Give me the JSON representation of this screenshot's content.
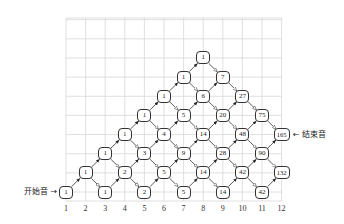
{
  "diagram": {
    "type": "lattice-path-counting",
    "grid": {
      "columns": 12,
      "rows": 10
    },
    "column_labels": [
      "1",
      "2",
      "3",
      "4",
      "5",
      "6",
      "7",
      "8",
      "9",
      "10",
      "11",
      "12"
    ],
    "start_label": "开始音",
    "start_arrow": "→",
    "end_label": "结束音",
    "end_arrow": "←",
    "nodes": [
      {
        "col": 1,
        "row": 0,
        "value": "1"
      },
      {
        "col": 3,
        "row": 0,
        "value": "1"
      },
      {
        "col": 5,
        "row": 0,
        "value": "2"
      },
      {
        "col": 7,
        "row": 0,
        "value": "5"
      },
      {
        "col": 9,
        "row": 0,
        "value": "14"
      },
      {
        "col": 11,
        "row": 0,
        "value": "42"
      },
      {
        "col": 2,
        "row": 1,
        "value": "1"
      },
      {
        "col": 4,
        "row": 1,
        "value": "2"
      },
      {
        "col": 6,
        "row": 1,
        "value": "5"
      },
      {
        "col": 8,
        "row": 1,
        "value": "14"
      },
      {
        "col": 10,
        "row": 1,
        "value": "42"
      },
      {
        "col": 12,
        "row": 1,
        "value": "132"
      },
      {
        "col": 3,
        "row": 2,
        "value": "1"
      },
      {
        "col": 5,
        "row": 2,
        "value": "3"
      },
      {
        "col": 7,
        "row": 2,
        "value": "9"
      },
      {
        "col": 9,
        "row": 2,
        "value": "28"
      },
      {
        "col": 11,
        "row": 2,
        "value": "90"
      },
      {
        "col": 4,
        "row": 3,
        "value": "1"
      },
      {
        "col": 6,
        "row": 3,
        "value": "4"
      },
      {
        "col": 8,
        "row": 3,
        "value": "14"
      },
      {
        "col": 10,
        "row": 3,
        "value": "48"
      },
      {
        "col": 12,
        "row": 3,
        "value": "165"
      },
      {
        "col": 5,
        "row": 4,
        "value": "1"
      },
      {
        "col": 7,
        "row": 4,
        "value": "5"
      },
      {
        "col": 9,
        "row": 4,
        "value": "20"
      },
      {
        "col": 11,
        "row": 4,
        "value": "75"
      },
      {
        "col": 6,
        "row": 5,
        "value": "1"
      },
      {
        "col": 8,
        "row": 5,
        "value": "6"
      },
      {
        "col": 10,
        "row": 5,
        "value": "27"
      },
      {
        "col": 7,
        "row": 6,
        "value": "1"
      },
      {
        "col": 9,
        "row": 6,
        "value": "7"
      },
      {
        "col": 8,
        "row": 7,
        "value": "1"
      }
    ],
    "colors": {
      "grid": "#d8d8d8",
      "stroke": "#333333",
      "text": "#222222"
    }
  }
}
